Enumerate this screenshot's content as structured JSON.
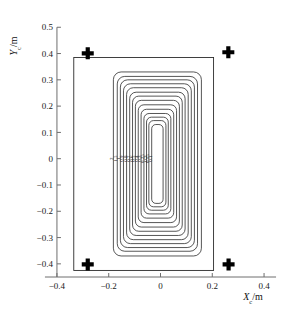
{
  "figure": {
    "background_color": "#ffffff",
    "line_color": "#2b2b2b",
    "marker_color": "#000000"
  },
  "axes": {
    "x_axis_label": "X",
    "x_axis_sub": "c",
    "x_axis_unit": "/m",
    "y_axis_label": "Y",
    "y_axis_sub": "c",
    "y_axis_unit": "/m"
  },
  "chart_data": {
    "type": "line",
    "title": "",
    "subtitle": "",
    "xlabel": "X_c/m",
    "ylabel": "Y_c/m",
    "xlim": [
      -0.45,
      0.45
    ],
    "ylim": [
      -0.45,
      0.52
    ],
    "grid": false,
    "legend_position": "none",
    "x_ticks": [
      -0.4,
      -0.2,
      0,
      0.2,
      0.4
    ],
    "x_tick_labels": [
      "−0.4",
      "−0.2",
      "0",
      "0.2",
      "0.4"
    ],
    "y_ticks": [
      -0.4,
      -0.3,
      -0.2,
      -0.1,
      0,
      0.1,
      0.2,
      0.3,
      0.4,
      0.5
    ],
    "y_tick_labels": [
      "−0.4",
      "−0.3",
      "−0.2",
      "−0.1",
      "0",
      "0.1",
      "0.2",
      "0.3",
      "0.4",
      "0.5"
    ],
    "boundary_rectangle": {
      "x_min": -0.335,
      "x_max": 0.205,
      "y_min": -0.425,
      "y_max": 0.385
    },
    "markers": {
      "name": "corner-crosses",
      "symbol": "plus",
      "points": [
        {
          "x": -0.281,
          "y": 0.401
        },
        {
          "x": 0.262,
          "y": 0.405
        },
        {
          "x": -0.281,
          "y": -0.402
        },
        {
          "x": 0.263,
          "y": -0.402
        }
      ]
    },
    "contours": {
      "description": "nested rounded-rectangle field-intensity contours",
      "center": {
        "x": -0.012,
        "y": -0.03
      },
      "levels": [
        2,
        1.5,
        1,
        0.9,
        0.8,
        0.7,
        0.6,
        0.5,
        0.4,
        0.3,
        0.25,
        0.2,
        0.15,
        0.1
      ],
      "level_labels": [
        "2",
        "1.5",
        "1",
        "0.9",
        "0.8",
        "0.7",
        "0.6",
        "0.5",
        "0.4",
        "0.3",
        "0.25",
        "0.2",
        "0.15",
        "0.1"
      ],
      "label_row_y": 0.0,
      "rings": [
        {
          "level": 2,
          "half_width": 0.17,
          "top": 0.33,
          "bottom": -0.37,
          "corner": 0.03
        },
        {
          "level": 1.5,
          "half_width": 0.155,
          "top": 0.313,
          "bottom": -0.352,
          "corner": 0.029
        },
        {
          "level": 1,
          "half_width": 0.143,
          "top": 0.3,
          "bottom": -0.338,
          "corner": 0.028
        },
        {
          "level": 0.9,
          "half_width": 0.131,
          "top": 0.285,
          "bottom": -0.323,
          "corner": 0.027
        },
        {
          "level": 0.8,
          "half_width": 0.119,
          "top": 0.27,
          "bottom": -0.308,
          "corner": 0.026
        },
        {
          "level": 0.7,
          "half_width": 0.107,
          "top": 0.253,
          "bottom": -0.292,
          "corner": 0.025
        },
        {
          "level": 0.6,
          "half_width": 0.096,
          "top": 0.238,
          "bottom": -0.276,
          "corner": 0.024
        },
        {
          "level": 0.5,
          "half_width": 0.085,
          "top": 0.222,
          "bottom": -0.26,
          "corner": 0.023
        },
        {
          "level": 0.4,
          "half_width": 0.074,
          "top": 0.205,
          "bottom": -0.243,
          "corner": 0.022
        },
        {
          "level": 0.3,
          "half_width": 0.063,
          "top": 0.188,
          "bottom": -0.226,
          "corner": 0.021
        },
        {
          "level": 0.25,
          "half_width": 0.052,
          "top": 0.172,
          "bottom": -0.21,
          "corner": 0.02
        },
        {
          "level": 0.2,
          "half_width": 0.042,
          "top": 0.158,
          "bottom": -0.196,
          "corner": 0.019
        },
        {
          "level": 0.15,
          "half_width": 0.033,
          "top": 0.145,
          "bottom": -0.183,
          "corner": 0.018
        },
        {
          "level": 0.1,
          "half_width": 0.022,
          "top": 0.13,
          "bottom": -0.17,
          "corner": 0.016
        }
      ]
    }
  }
}
